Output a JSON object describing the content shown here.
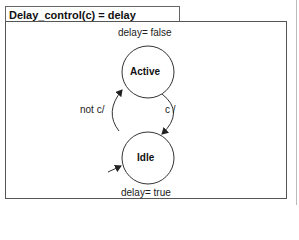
{
  "diagram": {
    "title": "Delay_control(c) = delay",
    "states": [
      {
        "name": "Active",
        "output": "delay= false"
      },
      {
        "name": "Idle",
        "output": "delay= true",
        "initial": true
      }
    ],
    "transitions": [
      {
        "from": "Active",
        "to": "Idle",
        "label": "c /"
      },
      {
        "from": "Idle",
        "to": "Active",
        "label": "not c/"
      }
    ]
  }
}
